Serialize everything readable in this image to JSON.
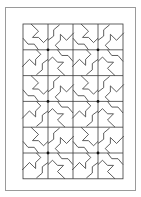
{
  "diagram": {
    "type": "quilt-pattern",
    "grid": {
      "columns": 4,
      "rows": 6
    },
    "block": {
      "cells_per_side": 2,
      "motif": "pinwheel",
      "center_dot": true
    },
    "colors": {
      "line": "#3a3a3a",
      "frame": "#9a9a9a",
      "background": "#ffffff",
      "dot": "#111111"
    }
  }
}
